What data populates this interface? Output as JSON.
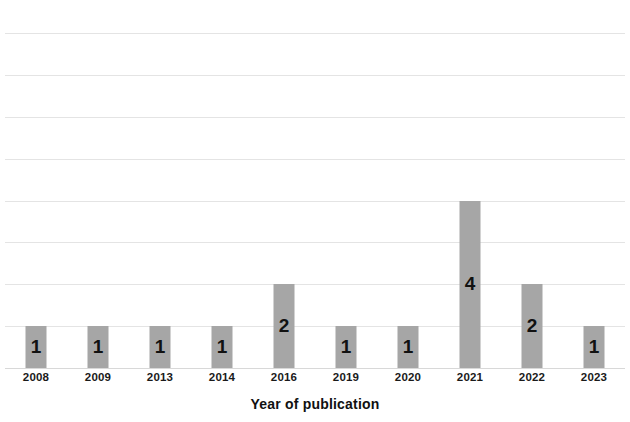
{
  "chart_data": {
    "type": "bar",
    "title": "",
    "subtitle": "",
    "xlabel": "Year of publication",
    "ylabel": "",
    "categories": [
      "2008",
      "2009",
      "2013",
      "2014",
      "2016",
      "2019",
      "2020",
      "2021",
      "2022",
      "2023"
    ],
    "values": [
      1,
      1,
      1,
      1,
      2,
      1,
      1,
      4,
      2,
      1
    ],
    "value_labels": [
      "1",
      "1",
      "1",
      "1",
      "2",
      "1",
      "1",
      "4",
      "2",
      "1"
    ],
    "ylim": [
      0,
      8
    ],
    "y_tick_labels": [],
    "gridlines": 8,
    "grid": true,
    "legend": false,
    "legend_position": "none",
    "bar_color": "#a6a6a6",
    "gridline_color": "#e4e4e4",
    "label_color": "#111111",
    "background_color": "#ffffff"
  }
}
